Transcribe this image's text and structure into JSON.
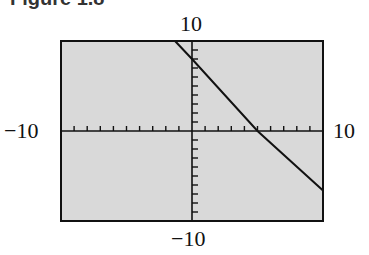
{
  "caption": "Figure 1.8",
  "chart_data": {
    "type": "line",
    "title": "Figure 1.8",
    "xlabel": "",
    "ylabel": "",
    "xlim": [
      -10,
      10
    ],
    "ylim": [
      -10,
      10
    ],
    "x_tick_step": 1,
    "y_tick_step": 1,
    "grid": false,
    "tick_labels": {
      "x_min": "−10",
      "x_max": "10",
      "y_min": "−10",
      "y_max": "10"
    },
    "series": [
      {
        "name": "line",
        "x": [
          -1.3,
          0,
          5,
          10
        ],
        "y": [
          10,
          8,
          0,
          -6.6
        ]
      }
    ],
    "background": "#d9d9d9",
    "line_color": "#111111"
  }
}
